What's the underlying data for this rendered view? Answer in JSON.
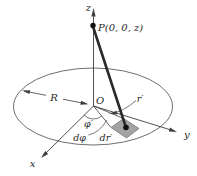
{
  "figure": {
    "colors": {
      "background": "#ffffff",
      "line": "#3f3f3f",
      "text": "#1f1f1f",
      "patch_fill": "#a3a3a3",
      "patch_stroke": "#6f6f6f",
      "point_fill": "#111111"
    },
    "labels": {
      "z_axis": "z",
      "x_axis": "x",
      "y_axis": "y",
      "point_p": "P(0, 0, z)",
      "disk_radius": "R",
      "origin": "O",
      "radial_coord": "r′",
      "azimuth_angle": "φ′",
      "d_azimuth": "dφ",
      "d_radial": "dr′"
    }
  }
}
